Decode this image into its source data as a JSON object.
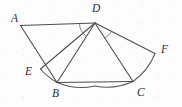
{
  "figure": {
    "kind": "plane-geometry-diagram",
    "canvas": {
      "width": 182,
      "height": 107
    },
    "background_color": "#fdfdfd",
    "stroke_color": "#4b4b52",
    "label_color": "#2e2e33",
    "points": [
      {
        "id": "A",
        "label": "A",
        "x": 20.5,
        "y": 25.5,
        "label_x": 11,
        "label_y": 13
      },
      {
        "id": "D",
        "label": "D",
        "x": 95.0,
        "y": 23.0,
        "label_x": 92,
        "label_y": 3
      },
      {
        "id": "F",
        "label": "F",
        "x": 155.0,
        "y": 53.5,
        "label_x": 161,
        "label_y": 44
      },
      {
        "id": "E",
        "label": "E",
        "x": 40.5,
        "y": 69.0,
        "label_x": 25,
        "label_y": 66
      },
      {
        "id": "B",
        "label": "B",
        "x": 57.0,
        "y": 82.5,
        "label_x": 52,
        "label_y": 88
      },
      {
        "id": "C",
        "label": "C",
        "x": 133.0,
        "y": 81.5,
        "label_x": 137,
        "label_y": 87
      }
    ],
    "segments": [
      {
        "id": "AD",
        "from": "A",
        "to": "D",
        "name": "segment-a-d"
      },
      {
        "id": "AB",
        "from": "A",
        "to": "B",
        "name": "segment-a-b"
      },
      {
        "id": "DE",
        "from": "D",
        "to": "E",
        "name": "segment-d-e"
      },
      {
        "id": "DB",
        "from": "D",
        "to": "B",
        "name": "segment-d-b"
      },
      {
        "id": "DC",
        "from": "D",
        "to": "C",
        "name": "segment-d-c"
      },
      {
        "id": "DF",
        "from": "D",
        "to": "F",
        "name": "segment-d-f"
      },
      {
        "id": "BC",
        "from": "B",
        "to": "C",
        "name": "segment-b-c"
      }
    ],
    "arcs": [
      {
        "id": "arc-EBC-F",
        "center": "D",
        "from": "E",
        "to": "F",
        "name": "sector-arc-e-b-c-f"
      }
    ],
    "angle_marks": [
      {
        "id": "angle-ADE",
        "vertex": "D",
        "between": [
          "A",
          "E"
        ],
        "name": "angle-mark-a-d-e"
      },
      {
        "id": "angle-CDF",
        "vertex": "D",
        "between": [
          "C",
          "F"
        ],
        "name": "angle-mark-c-d-f"
      }
    ],
    "labels_text": {
      "A": "A",
      "B": "B",
      "C": "C",
      "D": "D",
      "E": "E",
      "F": "F"
    }
  }
}
